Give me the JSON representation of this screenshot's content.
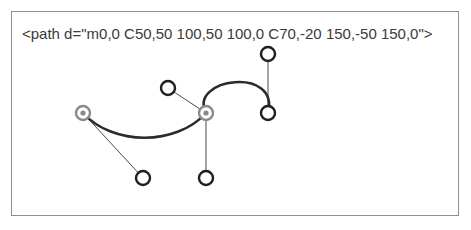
{
  "figure": {
    "background_color": "#ffffff",
    "frame": {
      "border_color": "#8d8d8d",
      "x": 11,
      "y": 11,
      "width": 448,
      "height": 205
    },
    "code_label": "<path d=\"m0,0 C50,50 100,50 100,0 C70,-20 150,-50 150,0\">",
    "code_color": "#3a3a3a"
  },
  "chart_data": {
    "type": "line",
    "xlabel": "",
    "ylabel": "",
    "grid": false,
    "legend": "none",
    "path_d": "m0,0 C50,50 100,50 100,0 C70,-20 150,-50 150,0",
    "curve_color": "#2b2b2b",
    "curve_width": 2.6,
    "handle_color": "#4a4a4a",
    "handle_width": 1,
    "anchor_color": "#8a8a8a",
    "control_color": "#1f1f1f",
    "marker_radius": 7,
    "marker_inner_radius": 3.2,
    "marker_stroke_width": 2.4,
    "anchors": [
      {
        "name": "start-anchor",
        "x": 83,
        "y": 113,
        "kind": "anchor"
      },
      {
        "name": "mid-anchor",
        "x": 206,
        "y": 113,
        "kind": "anchor"
      },
      {
        "name": "end-anchor",
        "x": 268,
        "y": 113,
        "kind": "control"
      }
    ],
    "controls": [
      {
        "name": "control-c1",
        "x": 143,
        "y": 178,
        "kind": "control"
      },
      {
        "name": "control-c2",
        "x": 168,
        "y": 88,
        "kind": "control"
      },
      {
        "name": "control-c3",
        "x": 206,
        "y": 178,
        "kind": "control"
      },
      {
        "name": "control-c4",
        "x": 268,
        "y": 54,
        "kind": "control"
      }
    ],
    "handles": [
      {
        "name": "handle-start-to-c1",
        "x1": 83,
        "y1": 113,
        "x2": 143,
        "y2": 178
      },
      {
        "name": "handle-mid-to-c2",
        "x1": 206,
        "y1": 113,
        "x2": 168,
        "y2": 88
      },
      {
        "name": "handle-mid-to-c3",
        "x1": 206,
        "y1": 113,
        "x2": 206,
        "y2": 178
      },
      {
        "name": "handle-end-to-c4",
        "x1": 268,
        "y1": 113,
        "x2": 268,
        "y2": 54
      }
    ],
    "curve_segments": [
      {
        "name": "segment-1",
        "d": "M 83,113 C 113,146 176,146 206,113"
      },
      {
        "name": "segment-2",
        "d": "M 206,113 C 188,78 280,66 268,113"
      }
    ]
  }
}
